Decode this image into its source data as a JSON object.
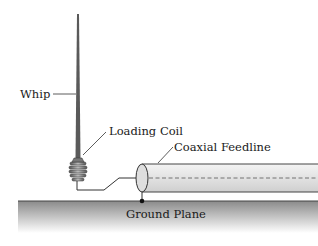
{
  "diagram": {
    "labels": {
      "whip": "Whip",
      "loading_coil": "Loading Coil",
      "coaxial_feedline": "Coaxial Feedline",
      "ground_plane": "Ground Plane"
    },
    "colors": {
      "whip": "#5a5a5a",
      "ground_top": "#8a8a8a",
      "ground_bottom": "#ffffff",
      "coax_fill": "#e6e6e6",
      "line": "#333333"
    }
  }
}
